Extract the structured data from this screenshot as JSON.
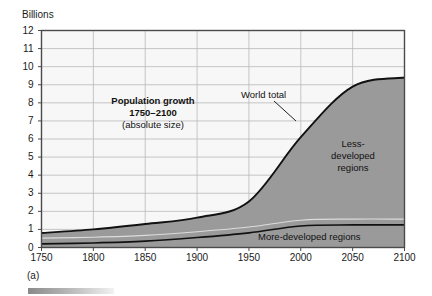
{
  "figure": {
    "panel_label": "(a)",
    "y_axis_title": "Billions"
  },
  "annotations": {
    "title_line1": "Population growth",
    "title_line2": "1750–2100",
    "title_line3": "(absolute size)",
    "world_total": "World total",
    "less_developed_line1": "Less-",
    "less_developed_line2": "developed",
    "less_developed_line3": "regions",
    "more_developed": "More-developed regions"
  },
  "colors": {
    "plot_background": "#f7f7f7",
    "band_fill": "#9a9a9a",
    "curve_stroke": "#111111",
    "grid": "#b9b9b9",
    "frame": "#4a4a4a",
    "inner_divider": "#e8e8e8"
  },
  "chart_data": {
    "type": "area",
    "title": "Population growth 1750–2100 (absolute size)",
    "xlabel": "",
    "ylabel": "Billions",
    "xlim": [
      1750,
      2100
    ],
    "ylim": [
      0,
      12
    ],
    "grid": true,
    "legend": "inline-annotations",
    "xticks": [
      1750,
      1800,
      1850,
      1900,
      1950,
      2000,
      2050,
      2100
    ],
    "yticks": [
      0,
      1,
      2,
      3,
      4,
      5,
      6,
      7,
      8,
      9,
      10,
      11,
      12
    ],
    "x": [
      1750,
      1800,
      1850,
      1900,
      1950,
      2000,
      2050,
      2100
    ],
    "series": [
      {
        "name": "World total",
        "values": [
          0.8,
          1.0,
          1.3,
          1.65,
          2.55,
          6.1,
          8.9,
          9.4
        ]
      },
      {
        "name": "More-developed regions",
        "values": [
          0.2,
          0.25,
          0.35,
          0.55,
          0.81,
          1.19,
          1.25,
          1.25
        ]
      },
      {
        "name": "Less-developed regions",
        "values": [
          0.6,
          0.75,
          0.95,
          1.1,
          1.74,
          4.91,
          7.65,
          8.15
        ]
      }
    ]
  }
}
